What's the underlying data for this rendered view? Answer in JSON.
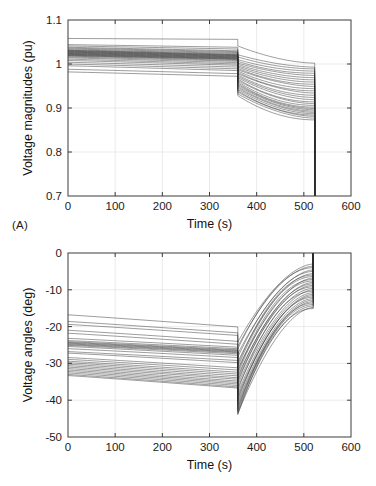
{
  "figure": {
    "background": "#ffffff",
    "panel_tags": [
      "(A)",
      "(B)"
    ],
    "curve_color": "#2b2b2b",
    "grid_color": "#e2e2e2",
    "axis_color": "#3c3c3c"
  },
  "chart_data": [
    {
      "id": "panel-a",
      "type": "line",
      "title": "",
      "panel_label": "(A)",
      "xlabel": "Time (s)",
      "ylabel": "Voltage magnitudes (pu)",
      "xlim": [
        0,
        600
      ],
      "ylim": [
        0.7,
        1.1
      ],
      "xticks": [
        0,
        100,
        200,
        300,
        400,
        500,
        600
      ],
      "xtick_labels": [
        "0",
        "100",
        "200",
        "300",
        "400",
        "500",
        "600"
      ],
      "yticks": [
        0.7,
        0.8,
        0.9,
        1.0,
        1.1
      ],
      "ytick_labels": [
        "0.7",
        "0.8",
        "0.9",
        "1",
        "1.1"
      ],
      "grid": true,
      "legend": "none",
      "annotations": [
        "step discontinuity at t = 360 s",
        "voltage collapse (vertical drop) at t = 523 s"
      ],
      "event_times": {
        "step": 360,
        "collapse": 523
      },
      "n_series": 30,
      "series_start_values": [
        1.058,
        1.044,
        1.041,
        1.038,
        1.036,
        1.034,
        1.032,
        1.031,
        1.03,
        1.029,
        1.028,
        1.027,
        1.026,
        1.025,
        1.024,
        1.023,
        1.022,
        1.021,
        1.02,
        1.019,
        1.018,
        1.016,
        1.014,
        1.011,
        1.008,
        1.004,
        1.0,
        0.996,
        0.988,
        0.982
      ],
      "series_prestep_end_values": [
        1.056,
        1.038,
        1.034,
        1.03,
        1.028,
        1.026,
        1.024,
        1.022,
        1.021,
        1.02,
        1.019,
        1.018,
        1.017,
        1.016,
        1.015,
        1.014,
        1.013,
        1.012,
        1.011,
        1.01,
        1.008,
        1.006,
        1.003,
        1.0,
        0.997,
        0.993,
        0.989,
        0.985,
        0.978,
        0.972
      ],
      "series_poststep_start_values": [
        1.041,
        1.021,
        1.016,
        1.01,
        1.006,
        1.002,
        0.999,
        0.996,
        0.993,
        0.99,
        0.987,
        0.984,
        0.981,
        0.978,
        0.975,
        0.972,
        0.969,
        0.966,
        0.963,
        0.96,
        0.957,
        0.954,
        0.951,
        0.948,
        0.945,
        0.942,
        0.939,
        0.936,
        0.932,
        0.928
      ],
      "series_collapse_values": [
        1.002,
        0.993,
        0.989,
        0.984,
        0.979,
        0.974,
        0.969,
        0.964,
        0.959,
        0.954,
        0.949,
        0.944,
        0.939,
        0.934,
        0.929,
        0.924,
        0.919,
        0.914,
        0.91,
        0.906,
        0.902,
        0.899,
        0.896,
        0.893,
        0.89,
        0.887,
        0.884,
        0.881,
        0.877,
        0.873
      ],
      "collapse_floor": 0.7
    },
    {
      "id": "panel-b",
      "type": "line",
      "title": "",
      "panel_label": "(B)",
      "xlabel": "Time (s)",
      "ylabel": "Voltage angles (deg)",
      "xlim": [
        0,
        600
      ],
      "ylim": [
        -50,
        0
      ],
      "xticks": [
        0,
        100,
        200,
        300,
        400,
        500,
        600
      ],
      "xtick_labels": [
        "0",
        "100",
        "200",
        "300",
        "400",
        "500",
        "600"
      ],
      "yticks": [
        -50,
        -40,
        -30,
        -20,
        -10,
        0
      ],
      "ytick_labels": [
        "-50",
        "-40",
        "-30",
        "-20",
        "-10",
        "0"
      ],
      "grid": true,
      "legend": "none",
      "annotations": [
        "step discontinuity at t = 360 s",
        "angles rise sharply to 0 at t = 520 s"
      ],
      "event_times": {
        "step": 360,
        "collapse": 520
      },
      "n_series": 30,
      "series_start_values": [
        -16.8,
        -18.6,
        -19.4,
        -21.0,
        -21.8,
        -23.2,
        -23.8,
        -24.1,
        -24.3,
        -24.5,
        -24.7,
        -24.9,
        -25.1,
        -25.4,
        -26.0,
        -26.8,
        -27.2,
        -28.4,
        -28.9,
        -29.4,
        -29.8,
        -30.2,
        -30.6,
        -31.0,
        -31.4,
        -31.8,
        -32.2,
        -32.6,
        -33.0,
        -33.3
      ],
      "series_prestep_end_values": [
        -20.1,
        -21.7,
        -22.4,
        -24.0,
        -24.8,
        -25.6,
        -26.0,
        -26.3,
        -26.5,
        -26.7,
        -26.9,
        -27.1,
        -27.4,
        -27.8,
        -28.4,
        -29.2,
        -29.8,
        -31.2,
        -31.8,
        -32.4,
        -32.9,
        -33.4,
        -33.9,
        -34.3,
        -34.8,
        -35.2,
        -35.6,
        -36.0,
        -36.4,
        -36.7
      ],
      "series_poststep_start_values": [
        -24.2,
        -25.4,
        -26.1,
        -27.4,
        -28.3,
        -29.6,
        -30.3,
        -31.0,
        -31.6,
        -32.2,
        -32.8,
        -33.4,
        -34.0,
        -34.6,
        -35.2,
        -35.9,
        -36.6,
        -37.4,
        -38.1,
        -38.8,
        -39.4,
        -40.0,
        -40.6,
        -41.2,
        -41.8,
        -42.3,
        -42.8,
        -43.2,
        -43.6,
        -43.9
      ],
      "series_collapse_values": [
        -3.0,
        -3.6,
        -4.0,
        -4.6,
        -5.0,
        -5.6,
        -6.0,
        -6.4,
        -6.8,
        -7.2,
        -7.6,
        -8.0,
        -8.4,
        -8.8,
        -9.2,
        -9.6,
        -10.0,
        -10.4,
        -10.8,
        -11.2,
        -11.6,
        -12.0,
        -12.4,
        -12.8,
        -13.2,
        -13.6,
        -14.0,
        -14.4,
        -14.8,
        -15.1
      ],
      "collapse_ceiling": 0
    }
  ]
}
